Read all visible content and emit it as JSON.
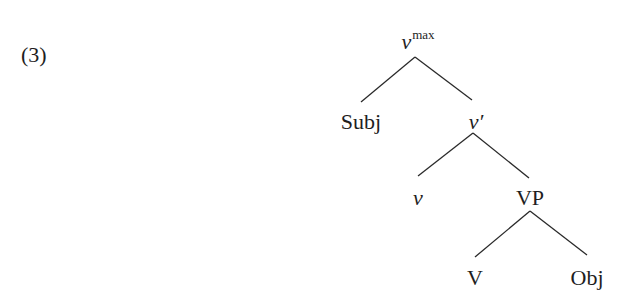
{
  "example": {
    "number": "(3)"
  },
  "tree": {
    "nodes": [
      {
        "id": "vmax",
        "label": "v",
        "superscript": "max",
        "italic": true
      },
      {
        "id": "subj",
        "label": "Subj",
        "italic": false
      },
      {
        "id": "vbar",
        "label": "v′",
        "italic": true
      },
      {
        "id": "v",
        "label": "v",
        "italic": true
      },
      {
        "id": "vp",
        "label": "VP",
        "italic": false
      },
      {
        "id": "V",
        "label": "V",
        "italic": false
      },
      {
        "id": "obj",
        "label": "Obj",
        "italic": false
      }
    ],
    "edges": [
      [
        "vmax",
        "subj"
      ],
      [
        "vmax",
        "vbar"
      ],
      [
        "vbar",
        "v"
      ],
      [
        "vbar",
        "vp"
      ],
      [
        "vp",
        "V"
      ],
      [
        "vp",
        "obj"
      ]
    ]
  }
}
